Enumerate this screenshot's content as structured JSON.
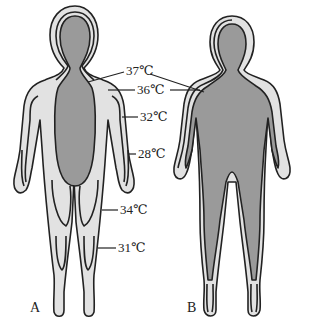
{
  "figure": {
    "panels": [
      {
        "id": "A",
        "label": "A"
      },
      {
        "id": "B",
        "label": "B"
      }
    ],
    "temperature_labels": [
      {
        "value": "37℃",
        "target": "core (both figures)"
      },
      {
        "value": "36℃",
        "target": "inner shell (both figures)"
      },
      {
        "value": "32℃",
        "target": "upper arm, figure A"
      },
      {
        "value": "28℃",
        "target": "forearm/hand, figure A"
      },
      {
        "value": "34℃",
        "target": "thigh, figure A"
      },
      {
        "value": "31℃",
        "target": "lower leg, figure A"
      }
    ],
    "colors": {
      "core": "#9a9a9a",
      "shell": "#e2e2e2",
      "outline": "#222222",
      "background": "#ffffff"
    }
  }
}
